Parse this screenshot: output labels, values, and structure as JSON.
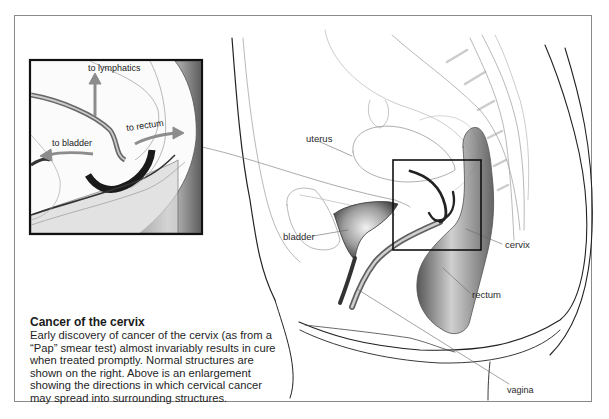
{
  "figure": {
    "caption": {
      "title": "Cancer of the cervix",
      "body": "Early discovery of cancer of the cervix (as from a “Pap” smear test) almost invariably results in cure when treated promptly. Normal structures are shown on the right. Above is an enlargement showing the directions in which cervical cancer may spread into surrounding structures."
    },
    "main_labels": {
      "uterus": "uterus",
      "bladder": "bladder",
      "cervix": "cervix",
      "rectum": "rectum",
      "vagina": "vagina"
    },
    "inset_labels": {
      "lymphatics": "to lymphatics",
      "bladder": "to bladder",
      "rectum": "to rectum"
    },
    "colors": {
      "frame": "#8a8a8a",
      "arrow": "#8c8c8c",
      "ink": "#1a1a1a",
      "outline": "#9a9a9a"
    }
  }
}
